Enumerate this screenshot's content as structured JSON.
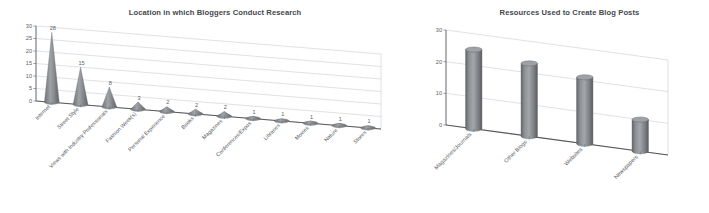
{
  "chart_data": [
    {
      "type": "bar",
      "title": "Location in which Bloggers Conduct Research",
      "xlabel": "",
      "ylabel": "",
      "ylim": [
        0,
        30
      ],
      "yticks": [
        0,
        5,
        10,
        15,
        20,
        25,
        30
      ],
      "grid": true,
      "legend": "none",
      "shape": "cone-3d",
      "categories": [
        "Internet",
        "Street Style",
        "Views with Industry Professionals",
        "Fashion Week(s)",
        "Personal Experience",
        "Books",
        "Magazines",
        "Conferences/Expos",
        "Libraries",
        "Movies",
        "Nature",
        "Stores"
      ],
      "values": [
        28,
        15,
        8,
        3,
        2,
        2,
        2,
        1,
        1,
        1,
        1,
        1
      ],
      "value_labels": [
        "28",
        "15",
        "8",
        "3",
        "2",
        "2",
        "2",
        "1",
        "1",
        "1",
        "1",
        "1"
      ]
    },
    {
      "type": "bar",
      "title": "Resources Used to Create Blog Posts",
      "xlabel": "",
      "ylabel": "",
      "ylim": [
        0,
        30
      ],
      "yticks": [
        0,
        10,
        20,
        30
      ],
      "grid": true,
      "legend": "none",
      "shape": "cylinder-3d",
      "categories": [
        "Magazines/Journals",
        "Other Blogs",
        "Websites",
        "Newspapers"
      ],
      "values": [
        25,
        23,
        21,
        10
      ],
      "value_labels": []
    }
  ],
  "colors": {
    "background": "#ffffff",
    "bar_fill": "#8d9094",
    "bar_edge": "#5c5f63",
    "gridline": "#c9ccd0",
    "axis": "#6f7377",
    "title_text": "#44484d",
    "tick_text": "#5a5e62"
  }
}
